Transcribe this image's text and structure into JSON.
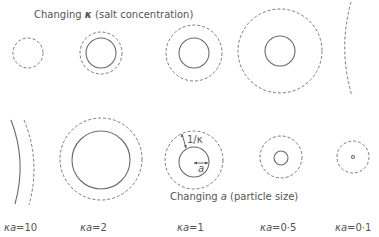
{
  "top_caption": {
    "prefix": "Changing ",
    "symbol": "κ",
    "suffix": " (salt concentration)"
  },
  "bottom_caption": {
    "prefix": "Changing ",
    "symbol": "a",
    "suffix": " (particle size)"
  },
  "annotations": {
    "debye_length": "1/κ",
    "radius": "a"
  },
  "labels": [
    {
      "symbol": "κa",
      "value": "=10"
    },
    {
      "symbol": "κa",
      "value": "=2"
    },
    {
      "symbol": "κa",
      "value": "=1"
    },
    {
      "symbol": "κa",
      "value": "=0·5"
    },
    {
      "symbol": "κa",
      "value": "=0·1"
    }
  ],
  "legend": {
    "solid_circle": "particle",
    "dashed_circle": "double layer (1/κ)"
  }
}
